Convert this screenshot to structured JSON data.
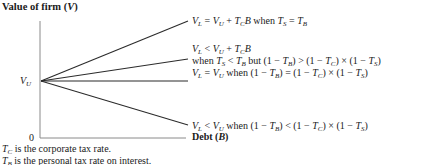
{
  "diagram": {
    "title_prefix": "Value of firm (",
    "title_var": "V",
    "title_suffix": ")",
    "y_intercept_label": "V",
    "y_intercept_sub": "U",
    "origin_label": "0",
    "x_axis_label_prefix": "Debt (",
    "x_axis_label_var": "B",
    "x_axis_label_suffix": ")",
    "lines": [
      {
        "id": "line-1",
        "end": [
          188,
          21
        ],
        "label_top": "V_L = V_U + T_C B when T_S = T_B"
      },
      {
        "id": "line-2",
        "end": [
          188,
          59
        ],
        "label_top": "V_L < V_U + T_C B",
        "label_bottom": "when T_S < T_B but (1 − T_B) > (1 − T_C) × (1 − T_S)"
      },
      {
        "id": "line-3",
        "end": [
          188,
          81
        ],
        "label_top": "V_L = V_U when (1 − T_B) = (1 − T_C) × (1 − T_S)"
      },
      {
        "id": "line-4",
        "end": [
          188,
          125
        ],
        "label_top": "V_L < V_U when (1 − T_B) < (1 − T_C) × (1 − T_S)"
      }
    ],
    "footnotes": [
      "is the corporate tax rate.",
      "is the personal tax rate on interest."
    ],
    "colors": {
      "line": "#2b2b2b",
      "axis": "#8a8a8a",
      "text": "#1a1a1a"
    }
  }
}
